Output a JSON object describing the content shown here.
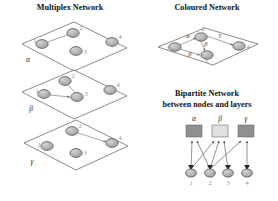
{
  "figure": {
    "background": "#ffffff",
    "width": 278,
    "height": 201
  },
  "panels": {
    "multiplex": {
      "title": "Multiplex Network",
      "title_pos": {
        "x": 70,
        "y": 10
      },
      "layer_labels": [
        "α",
        "β",
        "γ"
      ],
      "node_labels": [
        "1",
        "2",
        "3",
        "4"
      ],
      "layers": [
        {
          "name": "α",
          "label_pos": {
            "x": 28,
            "y": 62
          },
          "plane": "22,44 74,22 127,48 74,71",
          "nodes": [
            {
              "id": "1",
              "x": 42,
              "y": 44,
              "fill": "#a8a8a8",
              "label_dx": -7,
              "label_dy": -1
            },
            {
              "id": "2",
              "x": 73,
              "y": 33,
              "fill": "#a0a0a0",
              "label_dx": 8,
              "label_dy": -3
            },
            {
              "id": "3",
              "x": 76,
              "y": 51,
              "fill": "#b0b0b0",
              "label_dx": 9,
              "label_dy": 3
            },
            {
              "id": "4",
              "x": 112,
              "y": 42,
              "fill": "#a8a8a8",
              "label_dx": 8,
              "label_dy": -3
            }
          ],
          "edges": [
            {
              "from": "1",
              "to": "2"
            }
          ]
        },
        {
          "name": "β",
          "label_pos": {
            "x": 31,
            "y": 111
          },
          "plane": "22,92 74,70 127,96 74,119",
          "nodes": [
            {
              "id": "1",
              "x": 44,
              "y": 94,
              "fill": "#a2a2a2",
              "label_dx": -7,
              "label_dy": -1
            },
            {
              "id": "2",
              "x": 65,
              "y": 81,
              "fill": "#a8a8a8",
              "label_dx": 8,
              "label_dy": -3
            },
            {
              "id": "3",
              "x": 77,
              "y": 97,
              "fill": "#b0b0b0",
              "label_dx": 9,
              "label_dy": -1
            },
            {
              "id": "4",
              "x": 110,
              "y": 90,
              "fill": "#9e9e9e",
              "label_dx": 8,
              "label_dy": -3
            }
          ],
          "edges": [
            {
              "from": "2",
              "to": "3"
            },
            {
              "from": "1",
              "to": "3"
            }
          ]
        },
        {
          "name": "γ",
          "label_pos": {
            "x": 32,
            "y": 164
          },
          "plane": "24,143 76,120 128,146 76,170",
          "nodes": [
            {
              "id": "1",
              "x": 47,
              "y": 146,
              "fill": "#a8a8a8",
              "label_dx": -8,
              "label_dy": 1
            },
            {
              "id": "2",
              "x": 72,
              "y": 131,
              "fill": "#9a9a9a",
              "label_dx": 8,
              "label_dy": -3
            },
            {
              "id": "3",
              "x": 76,
              "y": 153,
              "fill": "#b2b2b2",
              "label_dx": 9,
              "label_dy": 2
            },
            {
              "id": "4",
              "x": 112,
              "y": 143,
              "fill": "#a2a2a2",
              "label_dx": 8,
              "label_dy": -3
            }
          ],
          "edges": [
            {
              "from": "2",
              "to": "4"
            }
          ]
        }
      ]
    },
    "coloured": {
      "title": "Coloured Network",
      "title_pos": {
        "x": 207,
        "y": 10
      },
      "plane": "158,47 205,28 258,44 213,65",
      "node_labels": [
        "1",
        "2",
        "3",
        "4"
      ],
      "nodes": [
        {
          "id": "1",
          "x": 175,
          "y": 47,
          "fill": "#a6a6a6",
          "label_dx": -7,
          "label_dy": 3
        },
        {
          "id": "2",
          "x": 201,
          "y": 37,
          "fill": "#a0a0a0",
          "label_dx": 2,
          "label_dy": -7
        },
        {
          "id": "3",
          "x": 207,
          "y": 55,
          "fill": "#b0b0b0",
          "label_dx": 8,
          "label_dy": 3
        },
        {
          "id": "4",
          "x": 239,
          "y": 46,
          "fill": "#a4a4a4",
          "label_dx": 8,
          "label_dy": 2
        }
      ],
      "edges": [
        {
          "from": "1",
          "to": "2",
          "colour": "α"
        },
        {
          "from": "2",
          "to": "3",
          "colour": "β"
        },
        {
          "from": "1",
          "to": "3",
          "colour": "β"
        },
        {
          "from": "2",
          "to": "4",
          "colour": "γ"
        }
      ],
      "edge_colour_labels": [
        "α",
        "β",
        "β",
        "γ"
      ]
    },
    "bipartite": {
      "title_line1": "Bipartite Network",
      "title_line2": "between nodes and layers",
      "title_pos": {
        "x": 207,
        "y": 96
      },
      "subtitle_pos": {
        "x": 207,
        "y": 107
      },
      "layer_labels": [
        "α",
        "β",
        "γ"
      ],
      "node_labels": [
        "1",
        "2",
        "3",
        "4"
      ],
      "layer_squares": [
        {
          "id": "α",
          "x": 186,
          "y": 125,
          "w": 16,
          "h": 12,
          "fill": "#8f8f8f",
          "label_y": 121
        },
        {
          "id": "β",
          "x": 212,
          "y": 125,
          "w": 16,
          "h": 12,
          "fill": "#e0e0e0",
          "label_y": 121
        },
        {
          "id": "γ",
          "x": 238,
          "y": 125,
          "w": 16,
          "h": 12,
          "fill": "#8f8f8f",
          "label_y": 121
        }
      ],
      "bottom_nodes": [
        {
          "id": "1",
          "x": 191,
          "y": 173,
          "fill": "#b4b4b4",
          "label_y": 185
        },
        {
          "id": "2",
          "x": 210,
          "y": 173,
          "fill": "#b4b4b4",
          "label_y": 185
        },
        {
          "id": "3",
          "x": 228,
          "y": 173,
          "fill": "#b4b4b4",
          "label_y": 185
        },
        {
          "id": "4",
          "x": 247,
          "y": 173,
          "fill": "#b4b4b4",
          "label_y": 185
        }
      ],
      "edges": [
        {
          "node": "1",
          "layer": "α"
        },
        {
          "node": "2",
          "layer": "α"
        },
        {
          "node": "1",
          "layer": "β"
        },
        {
          "node": "2",
          "layer": "β"
        },
        {
          "node": "3",
          "layer": "β"
        },
        {
          "node": "2",
          "layer": "γ"
        },
        {
          "node": "4",
          "layer": "γ"
        }
      ]
    }
  }
}
